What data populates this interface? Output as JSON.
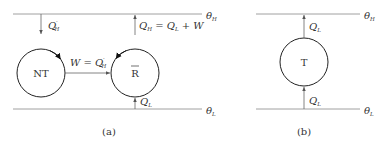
{
  "diagram_a": {
    "caption": "(a)",
    "top_reservoir": "θ",
    "top_reservoir_sub": "H",
    "bottom_reservoir": "θ",
    "bottom_reservoir_sub": "L",
    "engine_left": "NT",
    "engine_right": "R",
    "heat_in_left": "Q",
    "heat_in_left_prime": "′",
    "heat_in_left_sub": "H",
    "work_label": "W = Q",
    "work_label_prime": "′",
    "work_label_sub": "H",
    "heat_out_right": "Q",
    "heat_out_right_sub": "H",
    "heat_out_right_eq": " = Q",
    "heat_out_right_eq_sub": "L",
    "heat_out_right_tail": " + W",
    "heat_in_bottom": "Q",
    "heat_in_bottom_sub": "L"
  },
  "diagram_b": {
    "caption": "(b)",
    "top_reservoir": "θ",
    "top_reservoir_sub": "H",
    "bottom_reservoir": "θ",
    "bottom_reservoir_sub": "L",
    "engine": "T",
    "heat_out_top": "Q",
    "heat_out_top_sub": "L",
    "heat_in_bottom": "Q",
    "heat_in_bottom_sub": "L"
  }
}
